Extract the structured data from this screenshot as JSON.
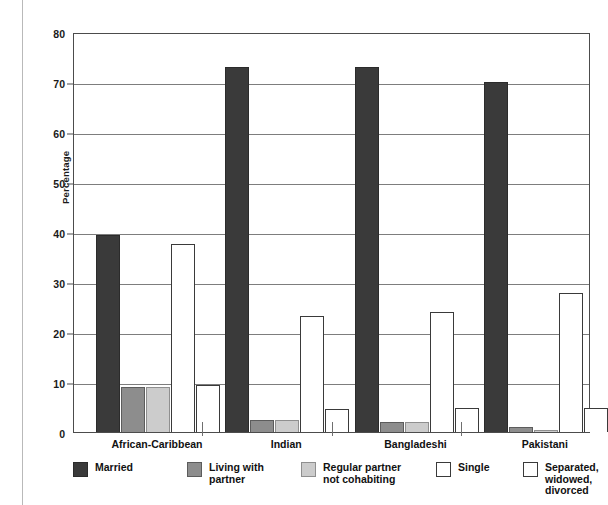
{
  "chart_data": {
    "type": "bar",
    "title": "",
    "subtitle": "",
    "xlabel": "",
    "ylabel": "Percentage",
    "ylim": [
      0,
      80
    ],
    "yticks": [
      0,
      10,
      20,
      30,
      40,
      50,
      60,
      70,
      80
    ],
    "ytick_labels": [
      "0",
      "10",
      "20",
      "30",
      "40",
      "50",
      "60",
      "70",
      "80"
    ],
    "grid": true,
    "legend_position": "bottom",
    "categories": [
      "African-Caribbean",
      "Indian",
      "Bangladeshi",
      "Pakistani"
    ],
    "series": [
      {
        "name": "Married",
        "color": "#3a3a3a",
        "border": "#2b2b2b",
        "values": [
          39.4,
          73.0,
          73.0,
          70.0
        ]
      },
      {
        "name": "Living with\npartner",
        "color": "#8d8d8d",
        "border": "#5c5c5c",
        "values": [
          9.0,
          2.5,
          2.0,
          1.0
        ]
      },
      {
        "name": "Regular partner\nnot cohabiting",
        "color": "#cccccc",
        "border": "#8f8f8f",
        "values": [
          9.0,
          2.5,
          2.0,
          0.5
        ]
      },
      {
        "name": "Single",
        "color": "#ffffff",
        "border": "#3a3a3a",
        "values": [
          37.6,
          23.2,
          24.0,
          27.8
        ]
      },
      {
        "name": "Separated, widowed,\ndivorced",
        "color": "#ffffff",
        "border": "#3a3a3a",
        "values": [
          9.5,
          4.6,
          4.8,
          4.8
        ]
      }
    ]
  },
  "legend": {
    "items": [
      {
        "label": "Married",
        "color": "#3a3a3a",
        "border": "#2b2b2b"
      },
      {
        "label": "Living with\npartner",
        "color": "#8d8d8d",
        "border": "#5c5c5c"
      },
      {
        "label": "Regular partner\nnot cohabiting",
        "color": "#cccccc",
        "border": "#8f8f8f"
      },
      {
        "label": "Single",
        "color": "#ffffff",
        "border": "#3a3a3a"
      },
      {
        "label": "Separated, widowed,\ndivorced",
        "color": "#ffffff",
        "border": "#3a3a3a"
      }
    ]
  }
}
